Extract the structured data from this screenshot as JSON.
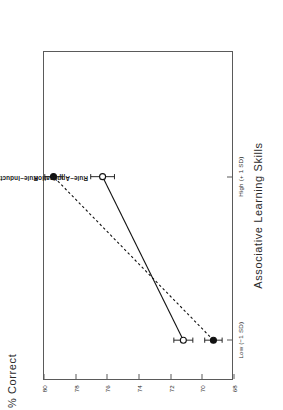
{
  "figure": {
    "rotation_note": "page-rotated-90",
    "background": "#ffffff",
    "ink": "#1a1a1a"
  },
  "chart_data": {
    "type": "line",
    "title": "",
    "xlabel": "Associative Learning Skills",
    "ylabel": "% Correct",
    "categories": [
      "Low (−1 SD)",
      "High (+ 1 SD)"
    ],
    "x": [
      0,
      1
    ],
    "ylim": [
      68,
      80
    ],
    "yticks": [
      80,
      78,
      76,
      74,
      72,
      70,
      68
    ],
    "ytick_labels": [
      "80",
      "78",
      "76",
      "74",
      "72",
      "70",
      "68"
    ],
    "xtick_labels": [
      "Low (−1 SD)",
      "High (+ 1 SD)"
    ],
    "grid": false,
    "legend": "inline-annotations",
    "series": [
      {
        "name": "Rule−Induction",
        "values": [
          69.3,
          79.4
        ],
        "errors": [
          0.55,
          0.55
        ],
        "marker": "filled-circle",
        "line_style": "dashed",
        "color": "#111111"
      },
      {
        "name": "Rule−Application",
        "values": [
          71.2,
          76.3
        ],
        "errors": [
          0.6,
          0.75
        ],
        "marker": "open-circle",
        "line_style": "solid",
        "color": "#111111"
      }
    ],
    "annotations": [
      {
        "text": "Rule−Induction",
        "series": 0
      },
      {
        "text": "Rule−Application",
        "series": 1
      }
    ]
  }
}
